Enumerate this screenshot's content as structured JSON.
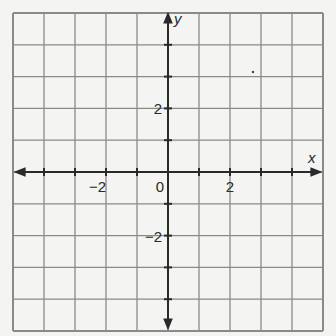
{
  "graph": {
    "x_axis_label": "x",
    "y_axis_label": "y",
    "x_range": [
      -5,
      5
    ],
    "y_range": [
      -5,
      5
    ],
    "grid_step": 1,
    "tick_labels": {
      "x": [
        {
          "value": -2,
          "text": "−2"
        },
        {
          "value": 0,
          "text": "0"
        },
        {
          "value": 2,
          "text": "2"
        }
      ],
      "y": [
        {
          "value": 2,
          "text": "2"
        },
        {
          "value": -2,
          "text": "−2"
        }
      ]
    },
    "colors": {
      "background": "#f4f4f2",
      "grid": "#8a8a8a",
      "axis": "#2a2a2a"
    }
  }
}
